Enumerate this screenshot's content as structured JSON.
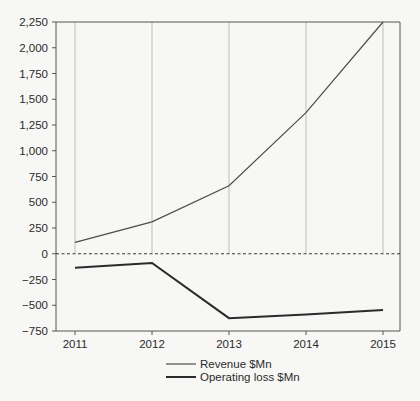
{
  "chart_data": {
    "type": "line",
    "title": "",
    "subtitle": "",
    "xlabel": "",
    "ylabel": "",
    "categories": [
      "2011",
      "2012",
      "2013",
      "2014",
      "2015"
    ],
    "x": [
      2011,
      2012,
      2013,
      2014,
      2015
    ],
    "series": [
      {
        "name": "Revenue $Mn",
        "values": [
          110,
          310,
          660,
          1370,
          2250
        ],
        "color": "#4d4d4d",
        "line_width": 1.2
      },
      {
        "name": "Operating loss $Mn",
        "values": [
          -135,
          -90,
          -625,
          -590,
          -545
        ],
        "color": "#2b2b2b",
        "line_width": 2.0
      }
    ],
    "ylim": [
      -750,
      2250
    ],
    "yticks": [
      -750,
      -500,
      -250,
      0,
      250,
      500,
      750,
      1000,
      1250,
      1500,
      1750,
      2000,
      2250
    ],
    "ytick_labels": [
      "−750",
      "−500",
      "−250",
      "0",
      "250",
      "500",
      "750",
      "1,000",
      "1,250",
      "1,500",
      "1,750",
      "2,000",
      "2,250"
    ],
    "xtick_labels": [
      "2011",
      "2012",
      "2013",
      "2014",
      "2015"
    ],
    "grid": {
      "vertical": true,
      "horizontal": false,
      "color": "#b5b5b5",
      "note": "vertical gridlines drawn from plot top down to the zero line only"
    },
    "zero_line": {
      "value": 0,
      "style": "dashed",
      "color": "#3a3a3a"
    },
    "legend": {
      "position": "bottom-center",
      "entries": [
        "Revenue $Mn",
        "Operating loss $Mn"
      ]
    },
    "axes": {
      "left_spine": true,
      "bottom_spine": true,
      "top_spine": true,
      "right_spine": true,
      "spine_color": "#555555"
    },
    "background_color": "#f7f7f5"
  }
}
